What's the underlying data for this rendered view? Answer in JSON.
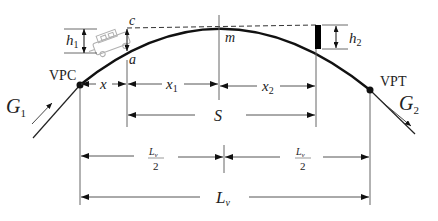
{
  "diagram": {
    "points": {
      "vpc": "VPC",
      "vpt": "VPT",
      "c": "c",
      "a": "a",
      "m": "m"
    },
    "grades": {
      "g1_main": "G",
      "g1_sub": "1",
      "g2_main": "G",
      "g2_sub": "2"
    },
    "heights": {
      "h1_main": "h",
      "h1_sub": "1",
      "h2_main": "h",
      "h2_sub": "2"
    },
    "dimensions": {
      "x": "x",
      "x1_main": "x",
      "x1_sub": "1",
      "x2_main": "x",
      "x2_sub": "2",
      "s": "S",
      "half_l_num_main": "L",
      "half_l_num_sub": "v",
      "half_l_den": "2",
      "l_main": "L",
      "l_sub": "v"
    },
    "colors": {
      "curve": "#111111",
      "dimension_lines": "#555555",
      "vehicle": "#b0b0b0",
      "object": "#000000"
    }
  }
}
